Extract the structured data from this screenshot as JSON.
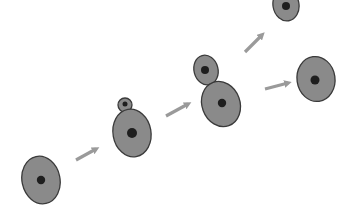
{
  "diagram": {
    "title": "",
    "colors": {
      "background": "#ffffff",
      "cytoplasm": "#8a8a8a",
      "outline": "#3a3a3a",
      "nucleus": "#1e1e1e",
      "arrow": "#9a9a9a"
    },
    "stages": [
      {
        "id": "stage-1",
        "label": "single-cell"
      },
      {
        "id": "stage-2",
        "label": "small-bud"
      },
      {
        "id": "stage-3",
        "label": "large-bud"
      },
      {
        "id": "stage-4",
        "label": "daughter-cell"
      },
      {
        "id": "stage-5",
        "label": "mother-cell"
      }
    ],
    "arrows": [
      {
        "from": "stage-1",
        "to": "stage-2"
      },
      {
        "from": "stage-2",
        "to": "stage-3"
      },
      {
        "from": "stage-3",
        "to": "stage-4"
      },
      {
        "from": "stage-3",
        "to": "stage-5"
      }
    ]
  }
}
